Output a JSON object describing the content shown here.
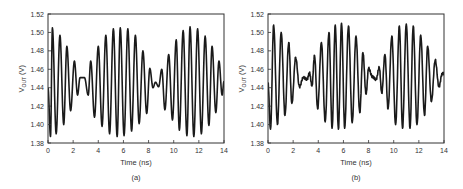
{
  "chart_data": [
    {
      "type": "line",
      "panel_label": "(a)",
      "title": "",
      "xlabel": "Time (ns)",
      "ylabel": "V_OUT (V)",
      "ylabel_main": "V",
      "ylabel_sub": "OUT",
      "ylabel_unit": "(V)",
      "xlim": [
        0,
        14
      ],
      "ylim": [
        1.38,
        1.52
      ],
      "xticks": [
        0,
        2,
        4,
        6,
        8,
        10,
        12,
        14
      ],
      "yticks": [
        1.38,
        1.4,
        1.42,
        1.44,
        1.46,
        1.48,
        1.5,
        1.52
      ],
      "grid": false,
      "legend": null,
      "series": [
        {
          "name": "V_OUT",
          "model": {
            "offset": 1.446,
            "amplitude": 0.059,
            "carrier_period_ns": 0.59,
            "carrier_phase_ns": 0.2,
            "envelope_period_ns": 11.2,
            "envelope_phase_ns": 0.0,
            "noise": 0.0,
            "start_value": 1.44
          },
          "extrema": [
            {
              "t": 0.2,
              "v": 1.387
            },
            {
              "t": 0.35,
              "v": 1.505
            },
            {
              "t": 0.65,
              "v": 1.39
            },
            {
              "t": 0.95,
              "v": 1.497
            },
            {
              "t": 1.25,
              "v": 1.4
            },
            {
              "t": 1.5,
              "v": 1.485
            },
            {
              "t": 1.8,
              "v": 1.415
            },
            {
              "t": 2.1,
              "v": 1.469
            },
            {
              "t": 2.35,
              "v": 1.432
            },
            {
              "t": 2.55,
              "v": 1.451
            },
            {
              "t": 2.9,
              "v": 1.451
            },
            {
              "t": 3.2,
              "v": 1.432
            },
            {
              "t": 3.4,
              "v": 1.469
            },
            {
              "t": 3.7,
              "v": 1.408
            },
            {
              "t": 4.0,
              "v": 1.485
            },
            {
              "t": 4.3,
              "v": 1.398
            },
            {
              "t": 4.6,
              "v": 1.497
            },
            {
              "t": 4.9,
              "v": 1.39
            },
            {
              "t": 5.2,
              "v": 1.504
            },
            {
              "t": 5.5,
              "v": 1.387
            },
            {
              "t": 5.75,
              "v": 1.505
            },
            {
              "t": 6.05,
              "v": 1.388
            },
            {
              "t": 6.35,
              "v": 1.504
            },
            {
              "t": 6.65,
              "v": 1.393
            },
            {
              "t": 6.95,
              "v": 1.497
            },
            {
              "t": 7.25,
              "v": 1.401
            },
            {
              "t": 7.55,
              "v": 1.48
            },
            {
              "t": 7.85,
              "v": 1.412
            },
            {
              "t": 8.1,
              "v": 1.461
            },
            {
              "t": 8.35,
              "v": 1.44
            },
            {
              "t": 8.55,
              "v": 1.446
            },
            {
              "t": 8.8,
              "v": 1.441
            },
            {
              "t": 9.05,
              "v": 1.46
            },
            {
              "t": 9.3,
              "v": 1.416
            },
            {
              "t": 9.6,
              "v": 1.476
            },
            {
              "t": 9.9,
              "v": 1.405
            },
            {
              "t": 10.2,
              "v": 1.492
            },
            {
              "t": 10.45,
              "v": 1.394
            },
            {
              "t": 10.75,
              "v": 1.502
            },
            {
              "t": 11.05,
              "v": 1.388
            },
            {
              "t": 11.3,
              "v": 1.506
            },
            {
              "t": 11.6,
              "v": 1.387
            },
            {
              "t": 11.9,
              "v": 1.504
            },
            {
              "t": 12.2,
              "v": 1.39
            },
            {
              "t": 12.5,
              "v": 1.496
            },
            {
              "t": 12.8,
              "v": 1.399
            },
            {
              "t": 13.05,
              "v": 1.485
            },
            {
              "t": 13.35,
              "v": 1.413
            },
            {
              "t": 13.6,
              "v": 1.469
            },
            {
              "t": 13.85,
              "v": 1.432
            },
            {
              "t": 14.0,
              "v": 1.447
            }
          ]
        }
      ]
    },
    {
      "type": "line",
      "panel_label": "(b)",
      "title": "",
      "xlabel": "Time (ns)",
      "ylabel": "V_OUT (V)",
      "ylabel_main": "V",
      "ylabel_sub": "OUT",
      "ylabel_unit": "(V)",
      "xlim": [
        0,
        14
      ],
      "ylim": [
        1.38,
        1.52
      ],
      "xticks": [
        0,
        2,
        4,
        6,
        8,
        10,
        12,
        14
      ],
      "yticks": [
        1.38,
        1.4,
        1.42,
        1.44,
        1.46,
        1.48,
        1.5,
        1.52
      ],
      "grid": false,
      "legend": null,
      "series": [
        {
          "name": "V_OUT",
          "model": {
            "offset": 1.451,
            "amplitude": 0.057,
            "carrier_period_ns": 0.59,
            "carrier_phase_ns": 0.2,
            "envelope_period_ns": 11.0,
            "envelope_phase_ns": 0.2,
            "noise": 0.004,
            "start_value": 1.445
          },
          "extrema": [
            {
              "t": 0.2,
              "v": 1.395
            },
            {
              "t": 0.45,
              "v": 1.508
            },
            {
              "t": 0.75,
              "v": 1.4
            },
            {
              "t": 1.05,
              "v": 1.5
            },
            {
              "t": 1.35,
              "v": 1.41
            },
            {
              "t": 1.65,
              "v": 1.489
            },
            {
              "t": 1.9,
              "v": 1.423
            },
            {
              "t": 2.2,
              "v": 1.473
            },
            {
              "t": 2.5,
              "v": 1.441
            },
            {
              "t": 2.8,
              "v": 1.451
            },
            {
              "t": 3.1,
              "v": 1.449
            },
            {
              "t": 3.3,
              "v": 1.456
            },
            {
              "t": 3.5,
              "v": 1.442
            },
            {
              "t": 3.7,
              "v": 1.475
            },
            {
              "t": 3.95,
              "v": 1.417
            },
            {
              "t": 4.25,
              "v": 1.489
            },
            {
              "t": 4.55,
              "v": 1.403
            },
            {
              "t": 4.85,
              "v": 1.5
            },
            {
              "t": 5.1,
              "v": 1.396
            },
            {
              "t": 5.35,
              "v": 1.508
            },
            {
              "t": 5.6,
              "v": 1.395
            },
            {
              "t": 5.85,
              "v": 1.51
            },
            {
              "t": 6.1,
              "v": 1.396
            },
            {
              "t": 6.4,
              "v": 1.507
            },
            {
              "t": 6.7,
              "v": 1.402
            },
            {
              "t": 7.0,
              "v": 1.496
            },
            {
              "t": 7.3,
              "v": 1.413
            },
            {
              "t": 7.55,
              "v": 1.478
            },
            {
              "t": 7.8,
              "v": 1.433
            },
            {
              "t": 8.0,
              "v": 1.461
            },
            {
              "t": 8.3,
              "v": 1.452
            },
            {
              "t": 8.6,
              "v": 1.449
            },
            {
              "t": 8.85,
              "v": 1.462
            },
            {
              "t": 9.05,
              "v": 1.434
            },
            {
              "t": 9.3,
              "v": 1.476
            },
            {
              "t": 9.55,
              "v": 1.417
            },
            {
              "t": 9.85,
              "v": 1.496
            },
            {
              "t": 10.15,
              "v": 1.4
            },
            {
              "t": 10.45,
              "v": 1.507
            },
            {
              "t": 10.7,
              "v": 1.396
            },
            {
              "t": 11.0,
              "v": 1.509
            },
            {
              "t": 11.3,
              "v": 1.396
            },
            {
              "t": 11.55,
              "v": 1.507
            },
            {
              "t": 11.85,
              "v": 1.4
            },
            {
              "t": 12.15,
              "v": 1.497
            },
            {
              "t": 12.45,
              "v": 1.41
            },
            {
              "t": 12.7,
              "v": 1.485
            },
            {
              "t": 13.0,
              "v": 1.425
            },
            {
              "t": 13.3,
              "v": 1.47
            },
            {
              "t": 13.6,
              "v": 1.441
            },
            {
              "t": 13.85,
              "v": 1.455
            },
            {
              "t": 14.0,
              "v": 1.455
            }
          ]
        }
      ]
    }
  ],
  "style": {
    "line_color": "#1a1a1a",
    "axis_color": "#333333",
    "background": "#ffffff"
  }
}
